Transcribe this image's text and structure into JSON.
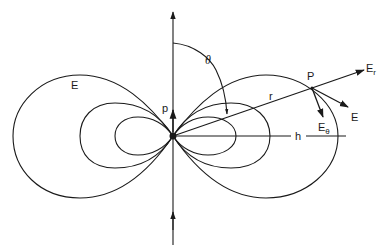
{
  "diagram": {
    "type": "electric dipole field lines",
    "labels": {
      "field_left": "E",
      "dipole": "p",
      "angle": "θ",
      "radius": "r",
      "point": "P",
      "radial_component": "E",
      "radial_component_sub": "r",
      "field_vector": "E",
      "theta_component": "E",
      "theta_component_sub": "θ",
      "distance": "h"
    },
    "colors": {
      "line": "#1a1a1a",
      "background": "#ffffff"
    },
    "geometry": {
      "dipole_center": [
        173,
        136
      ],
      "point_P": [
        312,
        88
      ],
      "lobes": 3
    }
  }
}
